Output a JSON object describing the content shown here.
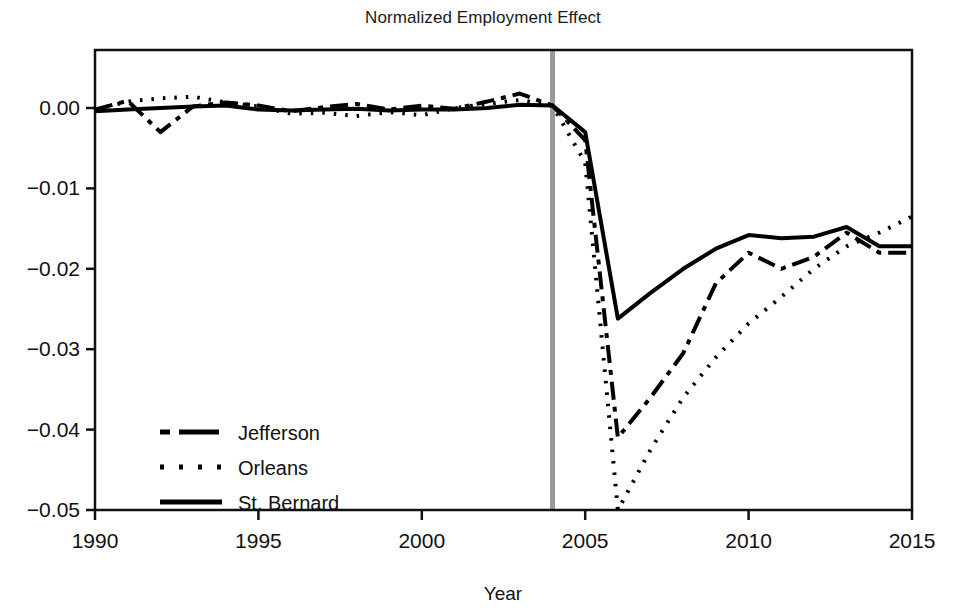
{
  "chart_data": {
    "type": "line",
    "title": "Normalized Employment Effect",
    "xlabel": "Year",
    "ylabel": "",
    "xlim": [
      1990,
      2015
    ],
    "ylim": [
      -0.055,
      0.004
    ],
    "xticks": [
      1990,
      1995,
      2000,
      2005,
      2010,
      2015
    ],
    "xticklabels": [
      "1990",
      "1995",
      "2000",
      "2005",
      "2010",
      "2015"
    ],
    "yticks": [
      0.0,
      -0.01,
      -0.02,
      -0.03,
      -0.04,
      -0.05
    ],
    "yticklabels": [
      "0.00",
      "−0.01",
      "−0.02",
      "−0.03",
      "−0.04",
      "−0.05"
    ],
    "grid": false,
    "legend_position": "lower left",
    "annotations": [
      {
        "name": "event-line",
        "type": "vertical-line",
        "x": 2004,
        "color": "#999999",
        "width": 5
      }
    ],
    "x": [
      1990,
      1991,
      1992,
      1993,
      1994,
      1995,
      1996,
      1997,
      1998,
      1999,
      2000,
      2001,
      2002,
      2003,
      2004,
      2005,
      2006,
      2007,
      2008,
      2009,
      2010,
      2011,
      2012,
      2013,
      2014,
      2015
    ],
    "series": [
      {
        "name": "Jefferson",
        "style": "dashdot",
        "color": "#000000",
        "values": [
          -0.0002,
          0.0009,
          -0.003,
          0.0002,
          0.0007,
          0.0003,
          -0.0004,
          0.0001,
          0.0005,
          -0.0002,
          0.0003,
          -0.0001,
          0.0008,
          0.0018,
          0.0003,
          -0.004,
          -0.041,
          -0.036,
          -0.0305,
          -0.0218,
          -0.018,
          -0.02,
          -0.0185,
          -0.0155,
          -0.018,
          -0.018
        ]
      },
      {
        "name": "Orleans",
        "style": "dotted",
        "color": "#000000",
        "values": [
          -0.0002,
          0.0008,
          0.0012,
          0.0014,
          0.0007,
          0.0002,
          -0.0007,
          -0.0006,
          -0.001,
          -0.0005,
          -0.0009,
          0.0,
          0.0005,
          0.001,
          0.0003,
          -0.0068,
          -0.05,
          -0.0425,
          -0.036,
          -0.031,
          -0.0268,
          -0.0235,
          -0.02,
          -0.0172,
          -0.0155,
          -0.0135
        ]
      },
      {
        "name": "St. Bernard",
        "style": "solid",
        "color": "#000000",
        "values": [
          -0.0004,
          -0.0002,
          0.0,
          0.0002,
          0.0003,
          -0.0002,
          -0.0003,
          -0.0002,
          -0.0001,
          -0.0003,
          -0.0002,
          -0.0002,
          0.0,
          0.0004,
          0.0003,
          -0.003,
          -0.0262,
          -0.023,
          -0.02,
          -0.0175,
          -0.0158,
          -0.0162,
          -0.016,
          -0.0148,
          -0.0172,
          -0.0172
        ]
      }
    ]
  },
  "legend": {
    "items": [
      {
        "label": "Jefferson",
        "style": "dashdot"
      },
      {
        "label": "Orleans",
        "style": "dotted"
      },
      {
        "label": "St. Bernard",
        "style": "solid"
      }
    ]
  }
}
